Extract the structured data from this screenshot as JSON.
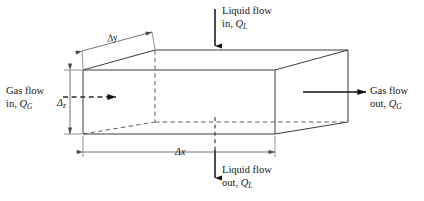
{
  "figure": {
    "type": "control-volume-schematic",
    "background_color": "#ffffff",
    "line_color": "#3c3c3c",
    "arrow_color": "#1a1a1a",
    "text_color": "#161616"
  },
  "flows": {
    "liquid_in": {
      "line1": "Liquid flow",
      "line2_prefix": "in, ",
      "symbol": "Q",
      "subscript": "L",
      "direction": "down",
      "arrow_style": "solid"
    },
    "liquid_out": {
      "line1": "Liquid flow",
      "line2_prefix": "out, ",
      "symbol": "Q",
      "subscript": "L",
      "direction": "down",
      "arrow_style": "solid"
    },
    "gas_in": {
      "line1": "Gas flow",
      "line2_prefix": "in, ",
      "symbol": "Q",
      "subscript": "G",
      "direction": "right",
      "arrow_style": "dashed"
    },
    "gas_out": {
      "line1": "Gas flow",
      "line2_prefix": "out, ",
      "symbol": "Q",
      "subscript": "G",
      "direction": "right",
      "arrow_style": "solid"
    }
  },
  "dimensions": {
    "depth": {
      "delta": "Δ",
      "axis": "y",
      "label": "Δy",
      "orientation": "oblique"
    },
    "height": {
      "delta": "Δ",
      "axis": "z",
      "label": "Δz",
      "orientation": "vertical"
    },
    "length": {
      "delta": "Δ",
      "axis": "x",
      "label": "Δx",
      "orientation": "horizontal"
    }
  },
  "geometry": {
    "front_face": {
      "left": 83,
      "top": 70,
      "right": 275,
      "bottom": 134
    },
    "back_face": {
      "left": 155,
      "top": 50,
      "right": 348,
      "bottom": 122
    },
    "hidden_edges": [
      "back-left-vertical",
      "back-bottom-horizontal",
      "bottom-left-diagonal"
    ]
  }
}
